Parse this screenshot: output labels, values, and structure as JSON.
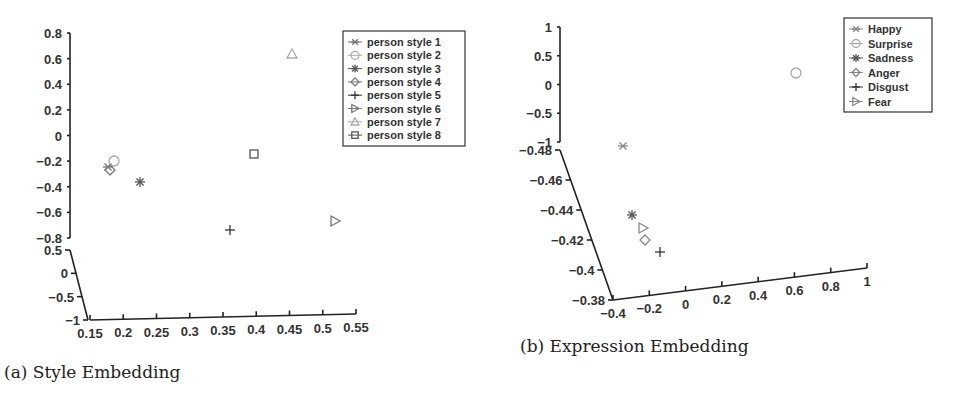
{
  "captions": {
    "a": "(a) Style Embedding",
    "b": "(b) Expression Embedding"
  },
  "chart_data": [
    {
      "type": "scatter",
      "projection": "3d",
      "title": "(a) Style Embedding",
      "z_axis": {
        "ticks": [
          0.8,
          0.6,
          0.4,
          0.2,
          0,
          -0.2,
          -0.4,
          -0.6,
          -0.8
        ],
        "tick_labels": [
          "0.8",
          "0.6",
          "0.4",
          "0.2",
          "0",
          "−0.2",
          "−0.4",
          "−0.6",
          "−0.8"
        ]
      },
      "y_axis": {
        "ticks": [
          0.5,
          0,
          -0.5,
          -1
        ],
        "tick_labels": [
          "0.5",
          "0",
          "−0.5",
          "−1"
        ]
      },
      "x_axis": {
        "ticks": [
          0.15,
          0.2,
          0.25,
          0.3,
          0.35,
          0.4,
          0.45,
          0.5,
          0.55
        ],
        "tick_labels": [
          "0.15",
          "0.2",
          "0.25",
          "0.3",
          "0.35",
          "0.4",
          "0.45",
          "0.5",
          "0.55"
        ]
      },
      "legend": {
        "position": "upper right",
        "entries": [
          {
            "label": "person style 1",
            "marker": "x-star",
            "color": "#777777"
          },
          {
            "label": "person style 2",
            "marker": "circle",
            "color": "#aaaaaa"
          },
          {
            "label": "person style 3",
            "marker": "asterisk",
            "color": "#555555"
          },
          {
            "label": "person style 4",
            "marker": "diamond",
            "color": "#777777"
          },
          {
            "label": "person style 5",
            "marker": "plus",
            "color": "#333333"
          },
          {
            "label": "person style 6",
            "marker": "triangle-right",
            "color": "#777777"
          },
          {
            "label": "person style 7",
            "marker": "triangle-up",
            "color": "#aaaaaa"
          },
          {
            "label": "person style 8",
            "marker": "square",
            "color": "#555555"
          }
        ]
      },
      "points_screen": [
        {
          "series": "person style 1",
          "x": 108,
          "y": 167,
          "approx_value": {
            "x": 0.17,
            "z": -0.2
          }
        },
        {
          "series": "person style 2",
          "x": 114,
          "y": 161,
          "approx_value": {
            "x": 0.18,
            "z": -0.15
          }
        },
        {
          "series": "person style 3",
          "x": 140,
          "y": 182,
          "approx_value": {
            "x": 0.22,
            "z": -0.32
          }
        },
        {
          "series": "person style 4",
          "x": 110,
          "y": 170,
          "approx_value": {
            "x": 0.18,
            "z": -0.22
          }
        },
        {
          "series": "person style 5",
          "x": 230,
          "y": 230,
          "approx_value": {
            "x": 0.36,
            "z": -0.65
          }
        },
        {
          "series": "person style 6",
          "x": 335,
          "y": 221,
          "approx_value": {
            "x": 0.52,
            "z": -0.6
          }
        },
        {
          "series": "person style 7",
          "x": 292,
          "y": 54,
          "approx_value": {
            "x": 0.45,
            "z": 0.62
          }
        },
        {
          "series": "person style 8",
          "x": 254,
          "y": 154,
          "approx_value": {
            "x": 0.39,
            "z": -0.12
          }
        }
      ]
    },
    {
      "type": "scatter",
      "projection": "3d",
      "title": "(b) Expression Embedding",
      "z_axis": {
        "ticks": [
          1,
          0.5,
          0,
          -0.5,
          -1
        ],
        "tick_labels": [
          "1",
          "0.5",
          "0",
          "−0.5",
          "−1"
        ]
      },
      "y_axis": {
        "ticks": [
          -0.48,
          -0.46,
          -0.44,
          -0.42,
          -0.4,
          -0.38
        ],
        "tick_labels": [
          "−0.48",
          "−0.46",
          "−0.44",
          "−0.42",
          "−0.4",
          "−0.38"
        ]
      },
      "x_axis": {
        "ticks": [
          -0.4,
          -0.2,
          0,
          0.2,
          0.4,
          0.6,
          0.8,
          1
        ],
        "tick_labels": [
          "−0.4",
          "−0.2",
          "0",
          "0.2",
          "0.4",
          "0.6",
          "0.8",
          "1"
        ]
      },
      "legend": {
        "position": "upper right",
        "entries": [
          {
            "label": "Happy",
            "marker": "x-star",
            "color": "#888888"
          },
          {
            "label": "Surprise",
            "marker": "circle",
            "color": "#aaaaaa"
          },
          {
            "label": "Sadness",
            "marker": "asterisk",
            "color": "#555555"
          },
          {
            "label": "Anger",
            "marker": "diamond",
            "color": "#888888"
          },
          {
            "label": "Disgust",
            "marker": "plus",
            "color": "#333333"
          },
          {
            "label": "Fear",
            "marker": "triangle-right",
            "color": "#888888"
          }
        ]
      },
      "points_screen": [
        {
          "series": "Happy",
          "x": 143,
          "y": 146
        },
        {
          "series": "Surprise",
          "x": 316,
          "y": 73
        },
        {
          "series": "Sadness",
          "x": 152,
          "y": 215
        },
        {
          "series": "Anger",
          "x": 165,
          "y": 240
        },
        {
          "series": "Disgust",
          "x": 180,
          "y": 252
        },
        {
          "series": "Fear",
          "x": 163,
          "y": 228
        }
      ]
    }
  ]
}
